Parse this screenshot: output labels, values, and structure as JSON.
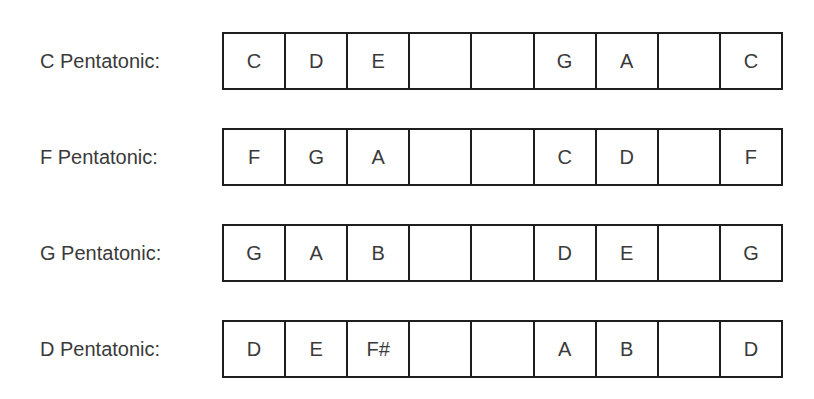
{
  "scales": [
    {
      "label": "C Pentatonic:",
      "cells": [
        "C",
        "D",
        "E",
        "",
        "",
        "G",
        "A",
        "",
        "C"
      ]
    },
    {
      "label": "F Pentatonic:",
      "cells": [
        "F",
        "G",
        "A",
        "",
        "",
        "C",
        "D",
        "",
        "F"
      ]
    },
    {
      "label": "G Pentatonic:",
      "cells": [
        "G",
        "A",
        "B",
        "",
        "",
        "D",
        "E",
        "",
        "G"
      ]
    },
    {
      "label": "D Pentatonic:",
      "cells": [
        "D",
        "E",
        "F#",
        "",
        "",
        "A",
        "B",
        "",
        "D"
      ]
    }
  ]
}
